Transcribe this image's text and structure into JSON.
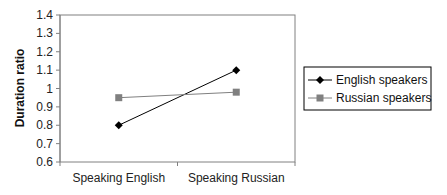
{
  "chart_data": {
    "type": "line",
    "title": "",
    "xlabel": "",
    "ylabel": "Duration ratio",
    "ylim": [
      0.6,
      1.4
    ],
    "yticks": [
      "0.6",
      "0.7",
      "0.8",
      "0.9",
      "1",
      "1.1",
      "1.2",
      "1.3",
      "1.4"
    ],
    "categories": [
      "Speaking English",
      "Speaking Russian"
    ],
    "series": [
      {
        "name": "English speakers",
        "values": [
          0.8,
          1.1
        ],
        "color": "#000000",
        "marker": "diamond"
      },
      {
        "name": "Russian speakers",
        "values": [
          0.95,
          0.98
        ],
        "color": "#808080",
        "marker": "square"
      }
    ],
    "grid": false,
    "legend_position": "right"
  }
}
